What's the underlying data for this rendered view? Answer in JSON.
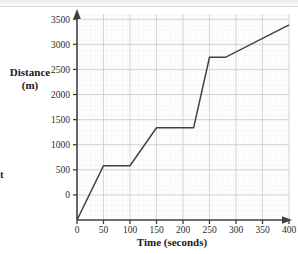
{
  "chart_data": {
    "type": "line",
    "title": "",
    "xlabel": "Time (seconds)",
    "ylabel": "Distance (m)",
    "ylabel_line1": "Distance",
    "ylabel_line2": "(m)",
    "xlim": [
      0,
      400
    ],
    "ylim": [
      0,
      3800
    ],
    "xticks": [
      0,
      50,
      100,
      150,
      200,
      250,
      300,
      350,
      400
    ],
    "yticks": [
      0,
      500,
      1000,
      1500,
      2000,
      2500,
      3000,
      3500
    ],
    "xtick_labels": [
      "0",
      "50",
      "100",
      "150",
      "200",
      "250",
      "300",
      "350",
      "400"
    ],
    "ytick_labels": [
      "0",
      "500",
      "1000",
      "1500",
      "2000",
      "2500",
      "3000",
      "3500"
    ],
    "grid": true,
    "minor_grid": true,
    "minor_grid_x_step": 10,
    "minor_grid_y_step": 100,
    "legend": null,
    "series": [
      {
        "name": "journey",
        "x": [
          0,
          50,
          100,
          150,
          220,
          250,
          280,
          400
        ],
        "y": [
          0,
          1000,
          1000,
          1700,
          1700,
          3000,
          3000,
          3600
        ]
      }
    ],
    "line_color": "#404040",
    "grid_color": "#d0d0d0",
    "minor_grid_color": "#ececec",
    "axis_color": "#404040"
  },
  "margin_text": {
    "fragment": "t"
  },
  "axes": {
    "x_arrow": "arrow-right",
    "y_arrow": "arrow-up"
  }
}
